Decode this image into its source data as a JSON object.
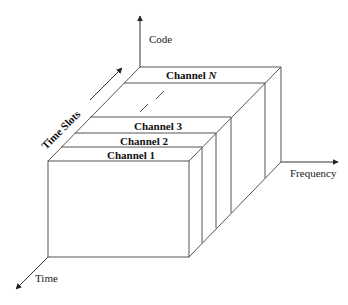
{
  "diagram": {
    "axes": {
      "code": "Code",
      "frequency": "Frequency",
      "time": "Time",
      "time_slots": "Time Slots"
    },
    "channels": [
      {
        "label": "Channel 1"
      },
      {
        "label": "Channel 2"
      },
      {
        "label": "Channel 3"
      },
      {
        "label": "Channel ",
        "suffix": "N"
      }
    ],
    "colors": {
      "line": "#555555",
      "text": "#111111",
      "background": "#ffffff"
    }
  }
}
